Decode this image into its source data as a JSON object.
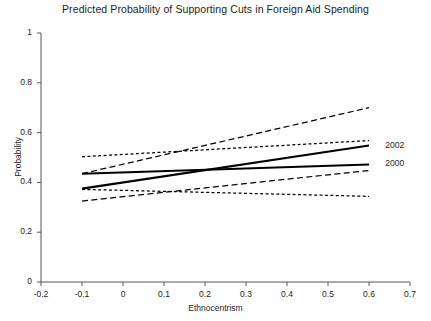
{
  "chart_data": {
    "type": "line",
    "title": "Predicted Probability of Supporting Cuts in Foreign Aid Spending",
    "xlabel": "Ethnocentrism",
    "ylabel": "Probability",
    "xlim": [
      -0.2,
      0.7
    ],
    "ylim": [
      0,
      1
    ],
    "grid": false,
    "legend_position": "right-inline",
    "xticks": [
      "-0.2",
      "-0.1",
      "0",
      "0.1",
      "0.2",
      "0.3",
      "0.4",
      "0.5",
      "0.6",
      "0.7"
    ],
    "xtick_values": [
      -0.2,
      -0.1,
      0,
      0.1,
      0.2,
      0.3,
      0.4,
      0.5,
      0.6,
      0.7
    ],
    "yticks": [
      "0",
      "0.2",
      "0.4",
      "0.6",
      "0.8",
      "1"
    ],
    "ytick_values": [
      0,
      0.2,
      0.4,
      0.6,
      0.8,
      1
    ],
    "x": [
      -0.1,
      0.6
    ],
    "series": [
      {
        "name": "2002",
        "label": "2002",
        "style": "solid",
        "color": "#000000",
        "values": [
          0.375,
          0.548
        ],
        "ci_upper": [
          0.435,
          0.7
        ],
        "ci_lower": [
          0.325,
          0.448
        ],
        "ci_style": "dashed"
      },
      {
        "name": "2000",
        "label": "2000",
        "style": "solid",
        "color": "#000000",
        "values": [
          0.435,
          0.472
        ],
        "ci_upper": [
          0.503,
          0.568
        ],
        "ci_lower": [
          0.372,
          0.344
        ],
        "ci_style": "dotted"
      }
    ],
    "annotations": [
      {
        "text": "2002",
        "x": 0.63,
        "y": 0.548
      },
      {
        "text": "2000",
        "x": 0.63,
        "y": 0.472
      }
    ],
    "colors": {
      "axis": "#555555",
      "line": "#000000",
      "text": "#1d1d1d"
    }
  }
}
